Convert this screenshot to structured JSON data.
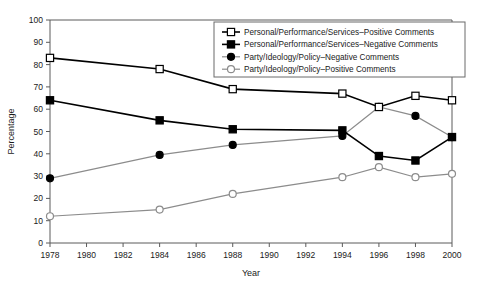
{
  "chart_data": {
    "type": "line",
    "title": "",
    "xlabel": "Year",
    "ylabel": "Percentage",
    "xlim": [
      1978,
      2000
    ],
    "ylim": [
      0,
      100
    ],
    "grid": false,
    "legend_position": "top-right-inside",
    "x": [
      1978,
      1984,
      1988,
      1994,
      1996,
      1998,
      2000
    ],
    "xticks": [
      1978,
      1980,
      1982,
      1984,
      1986,
      1988,
      1990,
      1992,
      1994,
      1996,
      1998,
      2000
    ],
    "yticks": [
      0,
      10,
      20,
      30,
      40,
      50,
      60,
      70,
      80,
      90,
      100
    ],
    "series": [
      {
        "name": "Personal/Performance/Services–Positive Comments",
        "marker": "open-square",
        "color": "#000000",
        "values": [
          83,
          78,
          69,
          67,
          61,
          66,
          64
        ]
      },
      {
        "name": "Personal/Performance/Services–Negative Comments",
        "marker": "filled-square",
        "color": "#000000",
        "values": [
          64,
          55,
          51,
          50.5,
          39,
          37,
          47.5
        ]
      },
      {
        "name": "Party/Ideology/Policy–Negative Comments",
        "marker": "filled-circle",
        "color": "#8c8c8c",
        "values": [
          29,
          39.5,
          44,
          48,
          61,
          57,
          47.5
        ]
      },
      {
        "name": "Party/Ideology/Policy–Positive Comments",
        "marker": "open-circle",
        "color": "#8c8c8c",
        "values": [
          12,
          15,
          22,
          29.5,
          34,
          29.5,
          31
        ]
      }
    ]
  }
}
